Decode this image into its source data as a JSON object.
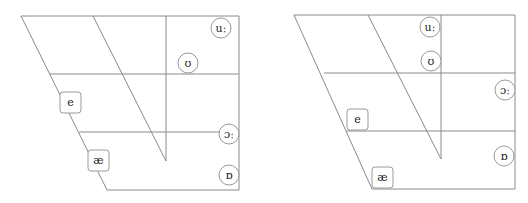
{
  "charts": [
    {
      "name": "vowel-chart-left",
      "vowels": {
        "uu": {
          "symbol": "uː",
          "shape": "circle"
        },
        "u": {
          "symbol": "ʊ",
          "shape": "circle"
        },
        "e": {
          "symbol": "e",
          "shape": "box"
        },
        "oo": {
          "symbol": "ɔː",
          "shape": "circle"
        },
        "ae": {
          "symbol": "æ",
          "shape": "box"
        },
        "o": {
          "symbol": "ɒ",
          "shape": "circle"
        }
      }
    },
    {
      "name": "vowel-chart-right",
      "vowels": {
        "uu": {
          "symbol": "uː",
          "shape": "circle"
        },
        "u": {
          "symbol": "ʊ",
          "shape": "circle"
        },
        "oo": {
          "symbol": "ɔː",
          "shape": "circle"
        },
        "e": {
          "symbol": "e",
          "shape": "box"
        },
        "o": {
          "symbol": "ɒ",
          "shape": "circle"
        },
        "ae": {
          "symbol": "æ",
          "shape": "box"
        }
      }
    }
  ],
  "colors": {
    "line": "#8a8a8a",
    "marker_stroke": "#9a9a9a",
    "text": "#222222"
  }
}
